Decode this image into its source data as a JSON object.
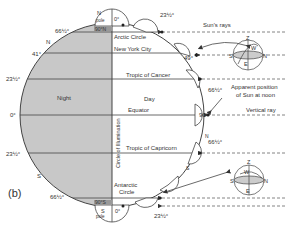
{
  "figure": {
    "panel_label": "(b)",
    "colors": {
      "night_fill": "#c8c8c8",
      "day_fill": "#ffffff",
      "line": "#444444",
      "ray": "#666666"
    },
    "globe": {
      "north_pole": {
        "label_n": "N",
        "label_pole": "pole",
        "lat": "90°N",
        "angle": "0°"
      },
      "south_pole": {
        "label_s": "S",
        "label_pole": "pole",
        "lat": "90°S",
        "angle": "0°"
      },
      "night_label": "Night",
      "day_label": "Day",
      "circle_of_illumination": "Circle of Illumination",
      "n_label": "N",
      "s_label": "S"
    },
    "latitudes_left": [
      {
        "label": "66½°"
      },
      {
        "label": "41°"
      },
      {
        "label": "23½°"
      },
      {
        "label": "0°"
      },
      {
        "label": "23½°"
      },
      {
        "label": "66½°"
      }
    ],
    "latitudes_right": [
      {
        "label": "Arctic Circle"
      },
      {
        "label": "New York City"
      },
      {
        "label": "Tropic of Cancer"
      },
      {
        "label": "Equator"
      },
      {
        "label": "Tropic of Capricorn"
      },
      {
        "label": "Antarctic"
      },
      {
        "label": "Circle"
      }
    ],
    "sun_angles": {
      "arctic": "23½°",
      "nyc": "49°",
      "cancer": "66½°",
      "equator": "90°",
      "capricorn": "66½°",
      "antarctic": "23½°"
    },
    "annotations": {
      "suns_rays": "Sun's rays",
      "apparent_position_1": "Apparent position",
      "apparent_position_2": "of Sun at noon",
      "vertical_ray": "Vertical ray"
    },
    "sky_dome": {
      "z": "Z",
      "w": "W",
      "s": "S",
      "n": "N",
      "e": "E"
    },
    "tick_labels": {
      "n": "N",
      "s": "S"
    }
  }
}
